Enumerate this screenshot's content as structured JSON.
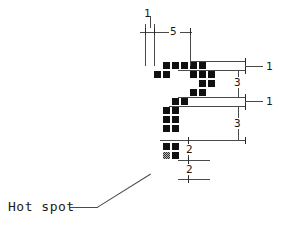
{
  "diagram": {
    "cell_size_px": 9,
    "colors": {
      "pixel_fill": "#111111",
      "hot_spot_fill": "#b9b9b9",
      "line": "#4a4a4a",
      "text": "#1a1a1a",
      "background": "#ffffff"
    },
    "annotation": {
      "hot_spot_label": "Hot spot"
    },
    "dimensions": [
      {
        "id": "top-offset",
        "label": "1",
        "orientation": "horizontal",
        "x": 144,
        "y": 10
      },
      {
        "id": "top-span",
        "label": "5",
        "orientation": "horizontal",
        "x": 171,
        "y": 32
      },
      {
        "id": "right-1a",
        "label": "1",
        "orientation": "vertical",
        "x": 266,
        "y": 64
      },
      {
        "id": "right-3a",
        "label": "3",
        "orientation": "vertical",
        "x": 240,
        "y": 82
      },
      {
        "id": "right-1b",
        "label": "1",
        "orientation": "vertical",
        "x": 266,
        "y": 104
      },
      {
        "id": "right-3b",
        "label": "3",
        "orientation": "vertical",
        "x": 240,
        "y": 128
      },
      {
        "id": "lower-2a",
        "label": "2",
        "orientation": "vertical",
        "x": 188,
        "y": 150
      },
      {
        "id": "lower-2b",
        "label": "2",
        "orientation": "vertical",
        "x": 188,
        "y": 170
      }
    ],
    "pixels": [
      {
        "col": 2,
        "row": 0,
        "hot": false
      },
      {
        "col": 3,
        "row": 0,
        "hot": false
      },
      {
        "col": 4,
        "row": 0,
        "hot": false
      },
      {
        "col": 5,
        "row": 0,
        "hot": false
      },
      {
        "col": 6,
        "row": 0,
        "hot": false
      },
      {
        "col": 1,
        "row": 1,
        "hot": false
      },
      {
        "col": 2,
        "row": 1,
        "hot": false
      },
      {
        "col": 5,
        "row": 1,
        "hot": false
      },
      {
        "col": 6,
        "row": 1,
        "hot": false
      },
      {
        "col": 7,
        "row": 1,
        "hot": false
      },
      {
        "col": 6,
        "row": 2,
        "hot": false
      },
      {
        "col": 7,
        "row": 2,
        "hot": false
      },
      {
        "col": 5,
        "row": 3,
        "hot": false
      },
      {
        "col": 6,
        "row": 3,
        "hot": false
      },
      {
        "col": 3,
        "row": 4,
        "hot": false
      },
      {
        "col": 4,
        "row": 4,
        "hot": false
      },
      {
        "col": 2,
        "row": 5,
        "hot": false
      },
      {
        "col": 3,
        "row": 5,
        "hot": false
      },
      {
        "col": 2,
        "row": 6,
        "hot": false
      },
      {
        "col": 3,
        "row": 6,
        "hot": false
      },
      {
        "col": 2,
        "row": 7,
        "hot": false
      },
      {
        "col": 3,
        "row": 7,
        "hot": false
      },
      {
        "col": 2,
        "row": 9,
        "hot": false
      },
      {
        "col": 3,
        "row": 9,
        "hot": false
      },
      {
        "col": 2,
        "row": 10,
        "hot": true
      },
      {
        "col": 3,
        "row": 10,
        "hot": false
      }
    ]
  }
}
